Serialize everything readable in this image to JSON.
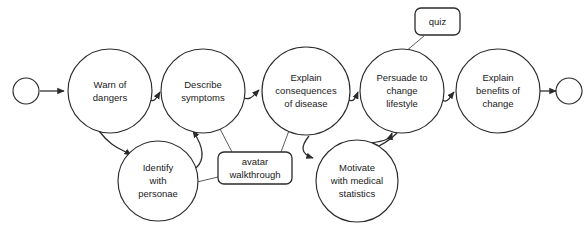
{
  "diagram": {
    "type": "activity-flow-diagram",
    "background_color": "#ffffff",
    "stroke_color": "#2b2b2b",
    "label_color": "#1a1a1a",
    "start_node": {
      "name": "start-node",
      "shape": "circle"
    },
    "end_node": {
      "name": "end-node",
      "shape": "circle"
    },
    "nodes": [
      {
        "id": "warn",
        "lines": [
          "Warn of",
          "dangers"
        ],
        "cx": 110,
        "cy": 91,
        "r": 42
      },
      {
        "id": "describe",
        "lines": [
          "Describe",
          "symptoms"
        ],
        "cx": 203,
        "cy": 91,
        "r": 42
      },
      {
        "id": "consequences",
        "lines": [
          "Explain",
          "consequences",
          "of disease"
        ],
        "cx": 306,
        "cy": 91,
        "r": 44
      },
      {
        "id": "persuade",
        "lines": [
          "Persuade to",
          "change",
          "lifestyle"
        ],
        "cx": 402,
        "cy": 91,
        "r": 42
      },
      {
        "id": "benefits",
        "lines": [
          "Explain",
          "benefits of",
          "change"
        ],
        "cx": 498,
        "cy": 91,
        "r": 42
      },
      {
        "id": "identify",
        "lines": [
          "Identify",
          "with",
          "personae"
        ],
        "cx": 158,
        "cy": 181,
        "r": 40
      },
      {
        "id": "motivate",
        "lines": [
          "Motivate",
          "with medical",
          "statistics"
        ],
        "cx": 357,
        "cy": 181,
        "r": 41
      }
    ],
    "notes": [
      {
        "id": "quiz",
        "label": "quiz",
        "x": 415,
        "y": 8,
        "width": 45,
        "height": 27
      },
      {
        "id": "avatar",
        "label": "avatar walkthrough",
        "lines": [
          "avatar",
          "walkthrough"
        ],
        "x": 218,
        "y": 152,
        "width": 74,
        "height": 32
      }
    ],
    "edges": [
      {
        "from": "start",
        "to": "warn"
      },
      {
        "from": "warn",
        "to": "describe"
      },
      {
        "from": "describe",
        "to": "consequences"
      },
      {
        "from": "consequences",
        "to": "persuade"
      },
      {
        "from": "persuade",
        "to": "benefits"
      },
      {
        "from": "benefits",
        "to": "end"
      },
      {
        "from": "warn",
        "to": "identify"
      },
      {
        "from": "identify",
        "to": "describe"
      },
      {
        "from": "consequences",
        "to": "motivate"
      },
      {
        "from": "motivate",
        "to": "persuade"
      }
    ],
    "note_links": [
      {
        "note": "quiz",
        "target": "persuade"
      },
      {
        "note": "avatar",
        "target": "identify"
      },
      {
        "note": "avatar",
        "target": "describe"
      },
      {
        "note": "avatar",
        "target": "consequences"
      }
    ]
  }
}
